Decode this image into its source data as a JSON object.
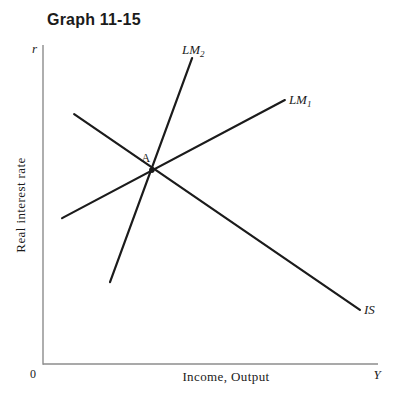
{
  "title": "Graph 11-15",
  "colors": {
    "background": "#ffffff",
    "curve": "#1b1b1b",
    "axis": "#8c8c8c",
    "text": "#1b1b1b"
  },
  "axes": {
    "y_top": "r",
    "y_label": "Real interest rate",
    "x_label": "Income, Output",
    "x_end": "Y",
    "origin": "0"
  },
  "chart_data": {
    "type": "line",
    "title": "Graph 11-15",
    "xlabel": "Income, Output",
    "ylabel": "Real interest rate",
    "axis_scale": "qualitative IS-LM diagram, no numeric ticks",
    "x_end_symbol": "Y",
    "y_end_symbol": "r",
    "origin": "0",
    "series": [
      {
        "name": "IS",
        "label_base": "IS",
        "label_sub": "",
        "slope": "downward",
        "points": [
          [
            0.093,
            0.784
          ],
          [
            0.946,
            0.172
          ]
        ],
        "label_at": [
          0.958,
          0.16
        ],
        "label_anchor": "start"
      },
      {
        "name": "LM1",
        "label_base": "LM",
        "label_sub": "1",
        "slope": "upward",
        "points": [
          [
            0.057,
            0.459
          ],
          [
            0.722,
            0.828
          ]
        ],
        "label_at": [
          0.734,
          0.816
        ],
        "label_anchor": "start"
      },
      {
        "name": "LM2",
        "label_base": "LM",
        "label_sub": "2",
        "slope": "upward-steep",
        "points": [
          [
            0.2,
            0.259
          ],
          [
            0.445,
            0.959
          ]
        ],
        "label_at": [
          0.415,
          0.972
        ],
        "label_anchor": "start"
      }
    ],
    "annotations": [
      {
        "label": "A",
        "description": "equilibrium intersection of IS, LM1 and LM2",
        "at": [
          0.307,
          0.634
        ],
        "marker_at": [
          0.325,
          0.609
        ]
      }
    ]
  }
}
